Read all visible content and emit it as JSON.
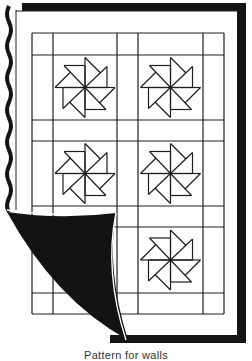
{
  "figure": {
    "caption": "Pattern for walls",
    "colors": {
      "frame": "#141414",
      "page": "#ffffff",
      "line": "#1e1e1e",
      "curl": "#121412"
    },
    "quilt": {
      "block_rows": 4,
      "block_cols": 2,
      "blocks": [
        {
          "row": 0,
          "col": 0,
          "motif": "pinwheel"
        },
        {
          "row": 0,
          "col": 1,
          "motif": "pinwheel"
        },
        {
          "row": 1,
          "col": 0,
          "motif": "pinwheel"
        },
        {
          "row": 1,
          "col": 1,
          "motif": "pinwheel"
        },
        {
          "row": 2,
          "col": 1,
          "motif": "pinwheel"
        }
      ],
      "pinwheel_count": 5,
      "curled_corner": "bottom-left"
    }
  }
}
